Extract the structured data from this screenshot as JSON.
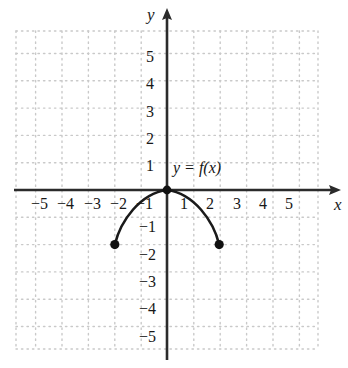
{
  "figure": {
    "kind": "cartesian-graph",
    "axis_labels": {
      "x": "x",
      "y": "y"
    },
    "curve_label": "y = f(x)",
    "colors": {
      "background": "#ffffff",
      "axis": "#2b2b2b",
      "grid": "#c9c9c9",
      "curve": "#1a1a1a",
      "point": "#111111",
      "text": "#181818"
    }
  },
  "chart_data": {
    "type": "line",
    "title": "",
    "xlabel": "x",
    "ylabel": "y",
    "xlim": [
      -6,
      6
    ],
    "ylim": [
      -6,
      6
    ],
    "grid": true,
    "grid_style": "dotted",
    "legend": "none",
    "annotations": [
      {
        "text": "y = f(x)",
        "x": 0.35,
        "y": 0.85
      }
    ],
    "x_ticks": [
      -5,
      -4,
      -3,
      -2,
      -1,
      1,
      2,
      3,
      4,
      5
    ],
    "y_ticks": [
      -5,
      -4,
      -3,
      -2,
      -1,
      1,
      2,
      3,
      4,
      5
    ],
    "x_tick_labels": [
      "−5",
      "−4",
      "−3",
      "−2",
      "−1",
      "1",
      "2",
      "3",
      "4",
      "5"
    ],
    "y_tick_labels": [
      "−5",
      "−4",
      "−3",
      "−2",
      "−1",
      "1",
      "2",
      "3",
      "4",
      "5"
    ],
    "series": [
      {
        "name": "f",
        "description": "downward arc (semicircle-like) peaking at the origin",
        "x": [
          -2,
          -1.8,
          -1.5,
          -1.2,
          -1,
          -0.75,
          -0.5,
          -0.25,
          0,
          0.25,
          0.5,
          0.75,
          1,
          1.2,
          1.5,
          1.8,
          2
        ],
        "y": [
          -2,
          -1.75,
          -1.45,
          -1.2,
          -1.05,
          -0.8,
          -0.55,
          -0.28,
          0,
          -0.28,
          -0.55,
          -0.8,
          -1.05,
          -1.2,
          -1.45,
          -1.75,
          -2
        ]
      }
    ],
    "endpoints": [
      {
        "x": -2,
        "y": -2,
        "style": "filled"
      },
      {
        "x": 0,
        "y": 0,
        "style": "filled"
      },
      {
        "x": 2,
        "y": -2,
        "style": "filled"
      }
    ]
  },
  "x_tick_items": [
    {
      "label": "−5",
      "left": 31,
      "top": 196
    },
    {
      "label": "−4",
      "left": 57,
      "top": 196
    },
    {
      "label": "−3",
      "left": 84,
      "top": 196
    },
    {
      "label": "−2",
      "left": 110,
      "top": 196
    },
    {
      "label": "−1",
      "left": 136,
      "top": 196
    },
    {
      "label": "1",
      "left": 180,
      "top": 196
    },
    {
      "label": "2",
      "left": 206,
      "top": 196
    },
    {
      "label": "3",
      "left": 233,
      "top": 196
    },
    {
      "label": "4",
      "left": 259,
      "top": 196
    },
    {
      "label": "5",
      "left": 285,
      "top": 196
    }
  ],
  "y_tick_items": [
    {
      "label": "5",
      "left": 146,
      "top": 49
    },
    {
      "label": "4",
      "left": 146,
      "top": 76
    },
    {
      "label": "3",
      "left": 146,
      "top": 104
    },
    {
      "label": "2",
      "left": 146,
      "top": 131
    },
    {
      "label": "1",
      "left": 146,
      "top": 158
    },
    {
      "label": "−1",
      "left": 139,
      "top": 219
    },
    {
      "label": "−2",
      "left": 139,
      "top": 247
    },
    {
      "label": "−3",
      "left": 139,
      "top": 274
    },
    {
      "label": "−4",
      "left": 139,
      "top": 301
    },
    {
      "label": "−5",
      "left": 139,
      "top": 329
    }
  ]
}
